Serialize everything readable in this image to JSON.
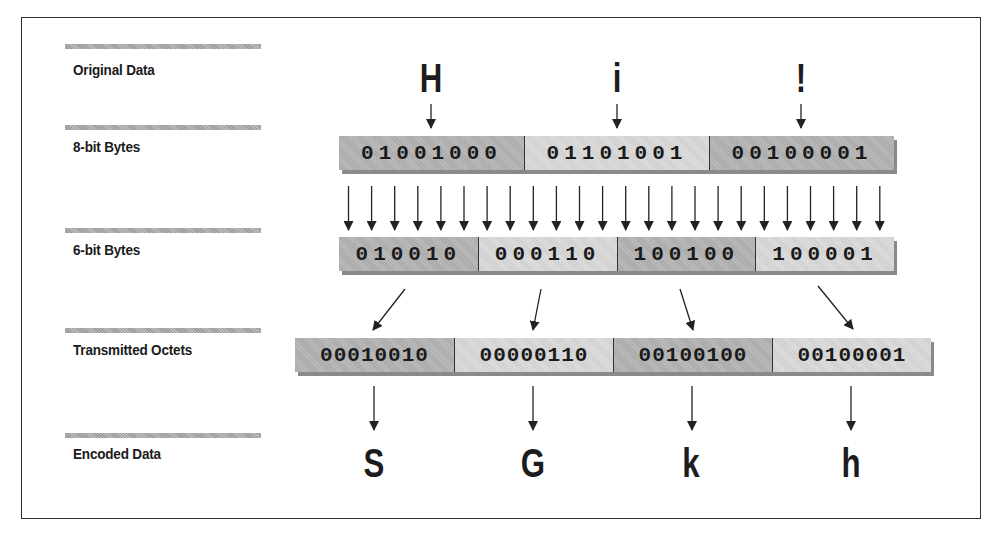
{
  "diagram": {
    "stages": [
      {
        "label": "Original Data"
      },
      {
        "label": "8-bit Bytes"
      },
      {
        "label": "6-bit Bytes"
      },
      {
        "label": "Transmitted Octets"
      },
      {
        "label": "Encoded Data"
      }
    ],
    "original_chars": [
      "H",
      "i",
      "!"
    ],
    "bytes_8bit": [
      "01001000",
      "01101001",
      "00100001"
    ],
    "bytes_6bit": [
      "010010",
      "000110",
      "100100",
      "100001"
    ],
    "transmitted_octets": [
      "00010010",
      "00000110",
      "00100100",
      "00100001"
    ],
    "encoded_chars": [
      "S",
      "G",
      "k",
      "h"
    ],
    "bit_arrows_count": 24
  }
}
